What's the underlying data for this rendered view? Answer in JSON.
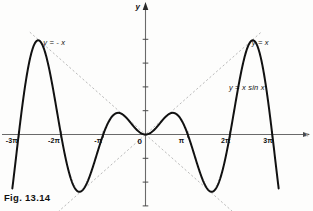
{
  "figure": {
    "caption": "Fig. 13.14",
    "background_color": "#fdfdfc",
    "curve_color": "#111111",
    "envelope_color": "#9a9a9a",
    "axis_color": "#5a5a5a"
  },
  "axes": {
    "y_axis_name": "y",
    "x_axis_name": "x",
    "origin_label": "0"
  },
  "labels": {
    "envelope_negative": "y = - x",
    "envelope_positive": "y = x",
    "curve": "y = x sin x"
  },
  "chart_data": {
    "type": "line",
    "title": "Fig. 13.14",
    "xlabel": "x",
    "ylabel": "y",
    "xlim": [
      -10.2,
      10.2
    ],
    "ylim": [
      -8.5,
      8.5
    ],
    "grid": false,
    "legend": "inline annotations",
    "xticks": [
      -9.4248,
      -6.2832,
      -3.1416,
      0,
      3.1416,
      6.2832,
      9.4248
    ],
    "xticklabels": [
      "-3π",
      "-2π",
      "-π",
      "0",
      "π",
      "2π",
      "3π"
    ],
    "yticks": [
      -8,
      -6,
      -4,
      -2,
      0,
      2,
      4,
      6,
      8
    ],
    "yticklabels": [
      "",
      "",
      "",
      "",
      "0",
      "",
      "",
      "",
      ""
    ],
    "series": [
      {
        "name": "y = x sin x",
        "style": "solid",
        "color": "#111111",
        "width": 2.0,
        "expression": "x*sin(x)",
        "x_range": [
          -9.9,
          9.9
        ],
        "key_points": [
          {
            "x": -9.4248,
            "y": 0,
            "kind": "zero"
          },
          {
            "x": -7.854,
            "y": 7.854,
            "kind": "maximum"
          },
          {
            "x": -6.2832,
            "y": 0,
            "kind": "zero"
          },
          {
            "x": -4.7124,
            "y": -4.712,
            "kind": "minimum"
          },
          {
            "x": -3.1416,
            "y": 0,
            "kind": "zero"
          },
          {
            "x": -1.5708,
            "y": 1.571,
            "kind": "maximum"
          },
          {
            "x": 0,
            "y": 0,
            "kind": "zero"
          },
          {
            "x": 1.5708,
            "y": 1.571,
            "kind": "maximum"
          },
          {
            "x": 3.1416,
            "y": 0,
            "kind": "zero"
          },
          {
            "x": 4.7124,
            "y": -4.712,
            "kind": "minimum"
          },
          {
            "x": 6.2832,
            "y": 0,
            "kind": "zero"
          },
          {
            "x": 7.854,
            "y": 7.854,
            "kind": "maximum"
          },
          {
            "x": 9.4248,
            "y": 0,
            "kind": "zero"
          }
        ]
      },
      {
        "name": "y = x",
        "style": "dashed",
        "color": "#9a9a9a",
        "width": 0.8,
        "expression": "x",
        "role": "upper envelope"
      },
      {
        "name": "y = - x",
        "style": "dashed",
        "color": "#9a9a9a",
        "width": 0.8,
        "expression": "-x",
        "role": "lower envelope"
      }
    ],
    "annotations": [
      {
        "text": "y = - x",
        "x": -7.6,
        "y": 8.1
      },
      {
        "text": "y = x",
        "x": 7.9,
        "y": 8.1
      },
      {
        "text": "y = x sin x",
        "x": 6.2,
        "y": 4.3
      }
    ]
  }
}
